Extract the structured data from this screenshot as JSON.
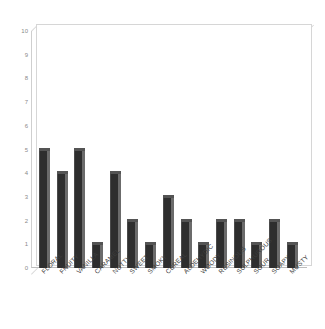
{
  "chart_data": {
    "type": "bar",
    "title": "",
    "subtitle": "",
    "xlabel": "",
    "ylabel": "",
    "ylim": [
      0,
      10
    ],
    "yticks": [
      0,
      1,
      2,
      3,
      4,
      5,
      6,
      7,
      8,
      9,
      10
    ],
    "grid": false,
    "legend": false,
    "legend_position": "none",
    "categories": [
      "FLORAL",
      "FRUITY",
      "VANILLA",
      "CARAMEL",
      "NUTTY",
      "SWEET",
      "SMOKY",
      "CEREAL",
      "ALDEHYDIC",
      "WOODY",
      "RESINOUS",
      "SULPHUROUS",
      "SOUR",
      "SOAPY",
      "MUSTY"
    ],
    "values": [
      5,
      4,
      5,
      1,
      4,
      2,
      1,
      3,
      2,
      1,
      2,
      2,
      1,
      2,
      1
    ],
    "colors": {
      "bar_face": "#2e2e2e",
      "bar_side": "#6b6b6b",
      "bar_top": "#545454",
      "axis": "#cfcfcf",
      "tick_text": "#8a8a8a",
      "label_text": "#3d3d3d",
      "background": "#ffffff"
    }
  }
}
